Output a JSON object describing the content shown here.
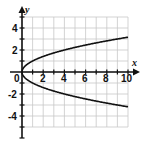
{
  "chart_data": {
    "type": "line",
    "title": "",
    "xlabel": "x",
    "ylabel": "y",
    "xlim": [
      0,
      10
    ],
    "ylim": [
      -5,
      5
    ],
    "grid": true,
    "legend": null,
    "x_ticks": [
      2,
      4,
      6,
      8,
      10
    ],
    "y_ticks": [
      4,
      2,
      -2,
      -4
    ],
    "origin_label": "0",
    "series": [
      {
        "name": "y = sqrt(x)",
        "x": [
          0,
          0.25,
          1,
          2,
          4,
          6,
          8,
          10
        ],
        "y": [
          0,
          0.5,
          1,
          1.41,
          2,
          2.45,
          2.83,
          3.16
        ]
      },
      {
        "name": "y = -sqrt(x)",
        "x": [
          0,
          0.25,
          1,
          2,
          4,
          6,
          8,
          10
        ],
        "y": [
          0,
          -0.5,
          -1,
          -1.41,
          -2,
          -2.45,
          -2.83,
          -3.16
        ]
      }
    ],
    "annotation": "Graph of x = y^2"
  },
  "labels": {
    "x_axis": "x",
    "y_axis": "y",
    "origin": "0",
    "xt2": "2",
    "xt4": "4",
    "xt6": "6",
    "xt8": "8",
    "xt10": "10",
    "yt4": "4",
    "yt2": "2",
    "ytm2": "-2",
    "ytm4": "-4"
  },
  "colors": {
    "grid": "#c8c8c8",
    "axis": "#111111",
    "curve": "#111111",
    "background": "#ffffff"
  }
}
